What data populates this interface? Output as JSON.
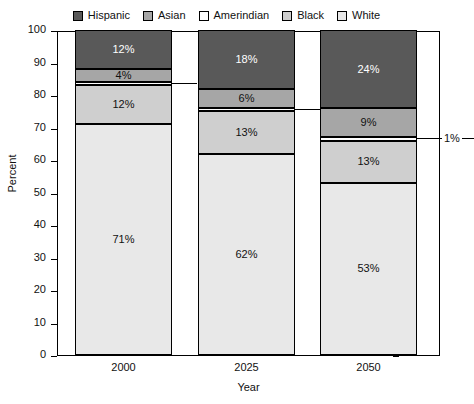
{
  "chart_data": {
    "type": "bar",
    "subtype": "stacked-bar-100",
    "title": "",
    "xlabel": "Year",
    "ylabel": "Percent",
    "ylim": [
      0,
      100
    ],
    "ytick_step": 10,
    "yticks": [
      100,
      90,
      80,
      70,
      60,
      50,
      40,
      30,
      20,
      10,
      0
    ],
    "grid": false,
    "legend_position": "top",
    "categories": [
      "2000",
      "2025",
      "2050"
    ],
    "series": [
      {
        "name": "Hispanic",
        "color": "#595959",
        "values": [
          12,
          18,
          24
        ],
        "labels": [
          "12%",
          "18%",
          "24%"
        ]
      },
      {
        "name": "Asian",
        "color": "#a6a6a6",
        "values": [
          4,
          6,
          9
        ],
        "labels": [
          "4%",
          "6%",
          "9%"
        ]
      },
      {
        "name": "Amerindian",
        "color": "#ffffff",
        "values": [
          1,
          1,
          1
        ],
        "labels": [
          "1%",
          "1%",
          "1%"
        ]
      },
      {
        "name": "Black",
        "color": "#cfcfcf",
        "values": [
          12,
          13,
          13
        ],
        "labels": [
          "12%",
          "13%",
          "13%"
        ]
      },
      {
        "name": "White",
        "color": "#e8e8e8",
        "values": [
          71,
          62,
          53
        ],
        "labels": [
          "71%",
          "62%",
          "53%"
        ]
      }
    ]
  },
  "legend": {
    "items": [
      {
        "label": "Hispanic",
        "color": "#595959"
      },
      {
        "label": "Asian",
        "color": "#a6a6a6"
      },
      {
        "label": "Amerindian",
        "color": "#ffffff"
      },
      {
        "label": "Black",
        "color": "#cfcfcf"
      },
      {
        "label": "White",
        "color": "#e8e8e8"
      }
    ]
  },
  "axes": {
    "y_title": "Percent",
    "x_title": "Year",
    "y_tick_labels": [
      "100",
      "90",
      "80",
      "70",
      "60",
      "50",
      "40",
      "30",
      "20",
      "10",
      "0"
    ],
    "x_tick_labels": [
      "2000",
      "2025",
      "2050"
    ]
  }
}
